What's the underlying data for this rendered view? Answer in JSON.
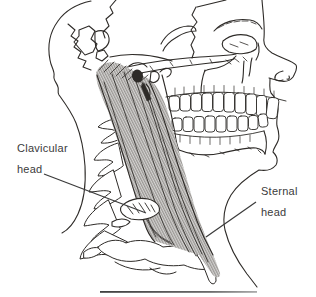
{
  "figure": {
    "background_color": "#ffffff",
    "ink_color": "#2e2b28",
    "muscle_fiber_color": "#3a342e",
    "label_text_color": "#3b3b3b",
    "rule_color_left": "#3f3f3f",
    "rule_color_right": "#ababab"
  },
  "annotations": {
    "clavicular_head": {
      "line1": "Clavicular",
      "line2": "head"
    },
    "sternal_head": {
      "line1": "Sternal",
      "line2": "head"
    }
  }
}
